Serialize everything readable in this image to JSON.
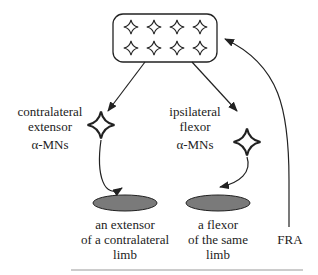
{
  "diagram": {
    "interneuron_pool": {
      "rows": 2,
      "cols": 4
    },
    "contralateral": {
      "line1": "contralateral",
      "line2": "extensor",
      "line3": "α-MNs"
    },
    "ipsilateral": {
      "line1": "ipsilateral",
      "line2": "flexor",
      "line3": "α-MNs"
    },
    "muscle_left": {
      "line1": "an extensor",
      "line2": "of a contralateral",
      "line3": "limb"
    },
    "muscle_right": {
      "line1": "a flexor",
      "line2": "of the same",
      "line3": "limb"
    },
    "input": {
      "label": "FRA"
    },
    "colors": {
      "line": "#222222",
      "muscle_fill": "#7a7a7a",
      "rule": "#999999"
    }
  }
}
